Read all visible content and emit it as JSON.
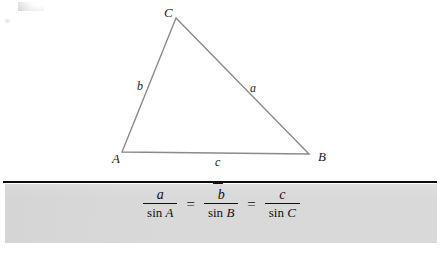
{
  "figure": {
    "type": "geometry-diagram",
    "triangle": {
      "vertices": [
        {
          "label": "C",
          "x": 176,
          "y": 18
        },
        {
          "label": "A",
          "x": 122,
          "y": 152
        },
        {
          "label": "B",
          "x": 309,
          "y": 154
        }
      ],
      "sides": [
        {
          "label": "a",
          "between": "B-C"
        },
        {
          "label": "b",
          "between": "A-C"
        },
        {
          "label": "c",
          "between": "A-B"
        }
      ],
      "stroke_color": "#8a8a8a"
    },
    "labels": {
      "vertex_a": "A",
      "vertex_b": "B",
      "vertex_c": "C",
      "side_a": "a",
      "side_b": "b",
      "side_c": "c"
    }
  },
  "callout": {
    "rule_color": "#0c0c0c",
    "marker_icon": "triangle-down-icon",
    "marker_color": "#111111",
    "panel_color": "#d9d9d9"
  },
  "formula": {
    "terms": [
      {
        "numerator": "a",
        "function": "sin",
        "denominator_variable": "A"
      },
      {
        "numerator": "b",
        "function": "sin",
        "denominator_variable": "B"
      },
      {
        "numerator": "c",
        "function": "sin",
        "denominator_variable": "C"
      }
    ],
    "equals_1": "=",
    "equals_2": "="
  }
}
